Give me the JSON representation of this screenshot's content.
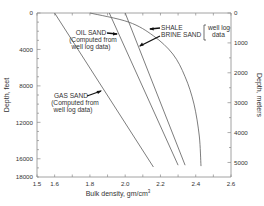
{
  "chart_data": {
    "type": "line",
    "title": "",
    "xlabel": "Bulk density, gm/cm³",
    "ylabel": "Depth, feet",
    "ylabel_right": "Depth, meters",
    "xlim": [
      1.5,
      2.6
    ],
    "ylim": [
      0,
      18000
    ],
    "y_inverted": true,
    "x_ticks": [
      "1.5",
      "1.6",
      "1.8",
      "2.0",
      "2.2",
      "2.4",
      "2.6"
    ],
    "y_ticks_left": [
      "0",
      "4000",
      "8000",
      "12000",
      "16000",
      "18000"
    ],
    "y_ticks_right": [
      "0",
      "1000",
      "2000",
      "3000",
      "4000",
      "5000"
    ],
    "grid": false,
    "series": [
      {
        "name": "GAS SAND",
        "note": "(Computed from well log data)",
        "points": [
          [
            1.6,
            0
          ],
          [
            2.16,
            16900
          ]
        ]
      },
      {
        "name": "OIL SAND",
        "note": "(Computed from well log data)",
        "points": [
          [
            1.91,
            0
          ],
          [
            2.3,
            16700
          ]
        ]
      },
      {
        "name": "BRINE SAND",
        "note": "well log data",
        "points": [
          [
            2.0,
            0
          ],
          [
            2.34,
            16700
          ]
        ]
      },
      {
        "name": "SHALE",
        "note": "well log data",
        "points": [
          [
            1.8,
            0
          ],
          [
            2.02,
            1000
          ],
          [
            2.16,
            2500
          ],
          [
            2.27,
            4500
          ],
          [
            2.34,
            7000
          ],
          [
            2.39,
            10000
          ],
          [
            2.42,
            13500
          ],
          [
            2.43,
            16800
          ]
        ]
      }
    ],
    "annotations": [
      {
        "text": "OIL SAND",
        "sub": [
          "(Computed from",
          "well log data)"
        ]
      },
      {
        "text": "GAS SAND",
        "sub": [
          "(Computed from",
          "well log data)"
        ]
      },
      {
        "text": "SHALE"
      },
      {
        "text": "BRINE SAND"
      },
      {
        "text": "well log data",
        "bracket": true
      }
    ]
  },
  "labels": {
    "xlabel": "Bulk density, gm/cm",
    "xlabel_sup": "3",
    "ylabel_left": "Depth, feet",
    "ylabel_right": "Depth, meters",
    "oil_sand": "OIL SAND",
    "oil_sand_sub1": "(Computed from",
    "oil_sand_sub2": "well log data)",
    "gas_sand": "GAS SAND",
    "gas_sand_sub1": "(Computed from",
    "gas_sand_sub2": "well log data)",
    "shale": "SHALE",
    "brine_sand": "BRINE SAND",
    "well_log_1": "well log",
    "well_log_2": "data"
  }
}
